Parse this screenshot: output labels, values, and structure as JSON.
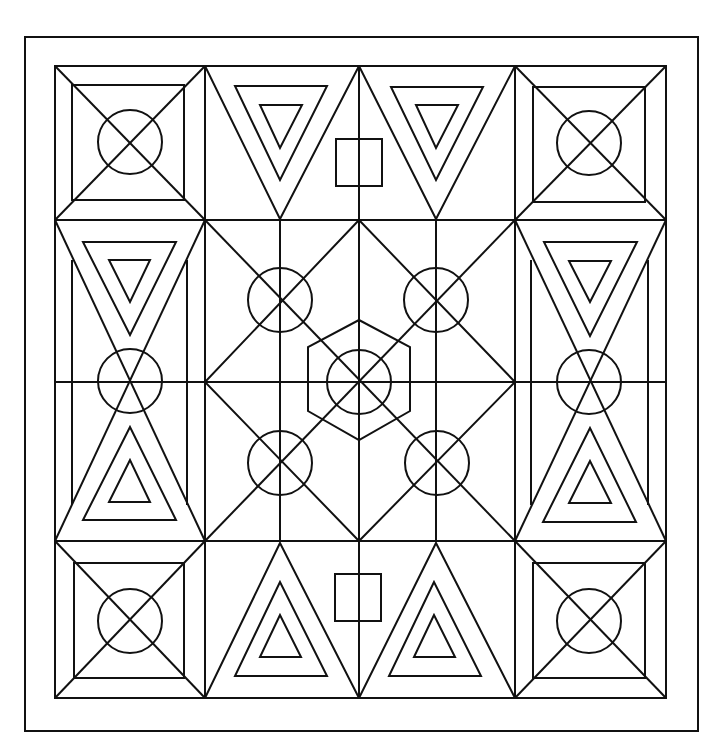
{
  "page": {
    "background": "#ffffff",
    "stroke_color": "#111111",
    "stroke_width": 2
  },
  "frame": {
    "outer": {
      "x": 25,
      "y": 37,
      "w": 673,
      "h": 694
    },
    "inner": {
      "x": 55,
      "y": 66,
      "w": 611,
      "h": 632
    }
  },
  "grid": {
    "columns_x": [
      55,
      205,
      359,
      515,
      666
    ],
    "rows_y": [
      66,
      220,
      382,
      541,
      698
    ]
  },
  "motifs": {
    "corner_tiles": 4,
    "corner_circles": 4,
    "top_inverted_triangle_sets": 2,
    "bottom_upright_triangle_sets": 2,
    "side_hourglass_panels": 2,
    "center_circles": 5,
    "center_hexagon": 1,
    "small_squares": 2
  }
}
